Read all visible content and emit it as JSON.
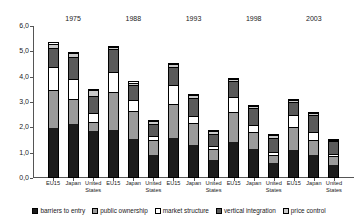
{
  "chart_data": {
    "type": "bar",
    "stacked": true,
    "title": "",
    "subtitle": "",
    "xlabel": "",
    "ylabel": "",
    "ylim": [
      0.0,
      6.0
    ],
    "ytick_labels": [
      "0,0",
      "1,0",
      "2,0",
      "3,0",
      "4,0",
      "5,0",
      "6,0"
    ],
    "ytick_values": [
      0.0,
      1.0,
      2.0,
      3.0,
      4.0,
      5.0,
      6.0
    ],
    "grid": false,
    "legend_position": "bottom",
    "group_labels": [
      "1975",
      "1988",
      "1993",
      "1998",
      "2003"
    ],
    "categories": [
      "EU15",
      "Japan",
      "United States",
      "EU15",
      "Japan",
      "United States",
      "EU15",
      "Japan",
      "United States",
      "EU15",
      "Japan",
      "United States",
      "EU15",
      "Japan",
      "United States"
    ],
    "series": [
      {
        "name": "barriers to entry",
        "color": "#1c1c1c",
        "values": [
          1.97,
          2.12,
          1.85,
          1.9,
          1.55,
          0.92,
          1.55,
          1.3,
          0.72,
          1.4,
          1.12,
          0.6,
          1.1,
          0.9,
          0.48
        ]
      },
      {
        "name": "public ownership",
        "color": "#9b9b9b",
        "values": [
          1.53,
          1.0,
          0.38,
          1.5,
          1.12,
          0.6,
          1.4,
          0.88,
          0.42,
          1.22,
          0.72,
          0.33,
          0.92,
          0.62,
          0.4
        ]
      },
      {
        "name": "market structure",
        "color": "#ffffff",
        "values": [
          0.9,
          0.82,
          0.35,
          0.82,
          0.42,
          0.17,
          0.73,
          0.3,
          0.12,
          0.62,
          0.28,
          0.1,
          0.48,
          0.3,
          0.07
        ]
      },
      {
        "name": "vertical integration",
        "color": "#5a5a5a",
        "values": [
          0.78,
          0.88,
          0.7,
          0.9,
          0.62,
          0.48,
          0.75,
          0.7,
          0.5,
          0.62,
          0.68,
          0.6,
          0.52,
          0.7,
          0.55
        ]
      },
      {
        "name": "price control",
        "color": "#c9c9c9",
        "values": [
          0.17,
          0.15,
          0.22,
          0.1,
          0.1,
          0.13,
          0.12,
          0.12,
          0.13,
          0.1,
          0.1,
          0.12,
          0.1,
          0.08,
          0.05
        ]
      }
    ],
    "totals": [
      5.35,
      4.97,
      3.5,
      5.22,
      3.81,
      2.3,
      4.55,
      3.3,
      1.89,
      3.96,
      2.9,
      1.75,
      3.12,
      2.6,
      1.55
    ]
  },
  "legend": {
    "items": [
      {
        "label": "barriers to entry",
        "swatch": "#1c1c1c"
      },
      {
        "label": "public ownership",
        "swatch": "#9b9b9b"
      },
      {
        "label": "market structure",
        "swatch": "#ffffff"
      },
      {
        "label": "vertical integration",
        "swatch": "#5a5a5a"
      },
      {
        "label": "price control",
        "swatch": "#c9c9c9"
      }
    ]
  }
}
